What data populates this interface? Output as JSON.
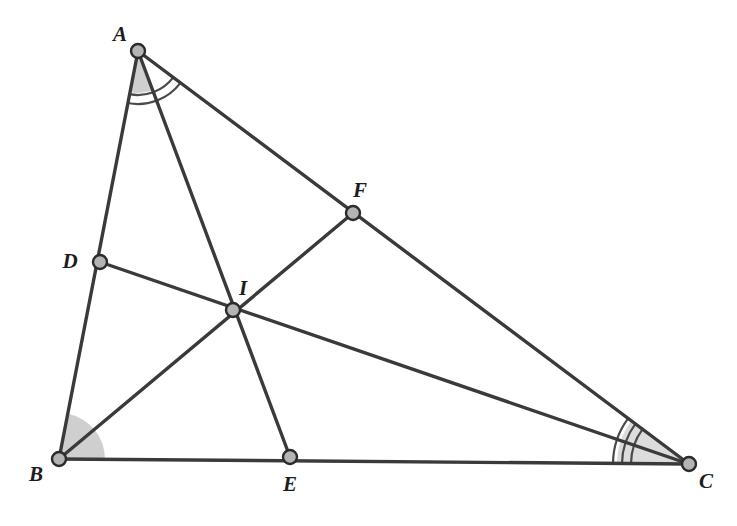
{
  "figure": {
    "type": "geometry-diagram",
    "width": 737,
    "height": 526,
    "background_color": "#ffffff"
  },
  "style": {
    "line_color": "#3a3a3a",
    "line_width": 3.4,
    "node_fill": "#b4b4b4",
    "node_stroke": "#2b2b2b",
    "node_radius": 7,
    "node_stroke_width": 2.4,
    "arc_color": "#4a4a4a",
    "arc_width": 2.2,
    "sector_fill": "#c9c9c9",
    "sector_fill_light": "#d8d8d8",
    "label_color": "#1c1c1c"
  },
  "points": [
    {
      "id": "A",
      "label": "A",
      "x": 138,
      "y": 51,
      "label_x": 120,
      "label_y": 34,
      "role": "triangle-vertex"
    },
    {
      "id": "B",
      "label": "B",
      "x": 59,
      "y": 459,
      "label_x": 36,
      "label_y": 474,
      "role": "triangle-vertex"
    },
    {
      "id": "C",
      "label": "C",
      "x": 689,
      "y": 464,
      "label_x": 706,
      "label_y": 481,
      "role": "triangle-vertex"
    },
    {
      "id": "D",
      "label": "D",
      "x": 100,
      "y": 262,
      "label_x": 70,
      "label_y": 261,
      "role": "cevian-foot-on-AB"
    },
    {
      "id": "E",
      "label": "E",
      "x": 290,
      "y": 457,
      "label_x": 290,
      "label_y": 484,
      "role": "cevian-foot-on-BC"
    },
    {
      "id": "F",
      "label": "F",
      "x": 353,
      "y": 213,
      "label_x": 360,
      "label_y": 190,
      "role": "cevian-foot-on-AC"
    },
    {
      "id": "I",
      "label": "I",
      "x": 233,
      "y": 310,
      "label_x": 243,
      "label_y": 288,
      "role": "incenter"
    }
  ],
  "segments": [
    {
      "id": "AB",
      "name": "side-ab",
      "from": "A",
      "to": "B"
    },
    {
      "id": "BC",
      "name": "side-bc",
      "from": "B",
      "to": "C"
    },
    {
      "id": "CA",
      "name": "side-ca",
      "from": "C",
      "to": "A"
    },
    {
      "id": "AE",
      "name": "bisector-ae",
      "from": "A",
      "to": "E"
    },
    {
      "id": "BF",
      "name": "bisector-bf",
      "from": "B",
      "to": "F"
    },
    {
      "id": "CD",
      "name": "bisector-cd",
      "from": "C",
      "to": "D"
    }
  ],
  "angle_marks": [
    {
      "id": "angle-a-sector",
      "vertex": "A",
      "from": "B",
      "to": "E",
      "kind": "filled-sector",
      "radius": 42,
      "fill": "#cfcfcf"
    },
    {
      "id": "angle-a-arcs",
      "vertex": "A",
      "from": "B",
      "to": "C",
      "kind": "arcs",
      "count": 2,
      "radii": [
        44,
        53
      ]
    },
    {
      "id": "angle-b-sector",
      "vertex": "B",
      "from": "A",
      "to": "C",
      "kind": "filled-sector",
      "radius": 46,
      "fill": "#cfcfcf"
    },
    {
      "id": "angle-c-sector",
      "vertex": "C",
      "from": "B",
      "to": "A",
      "kind": "filled-sector",
      "radius": 72,
      "fill": "#dcdcdc"
    },
    {
      "id": "angle-c-arcs",
      "vertex": "C",
      "from": "B",
      "to": "A",
      "kind": "arcs",
      "count": 3,
      "radii": [
        58,
        67,
        76
      ]
    }
  ]
}
